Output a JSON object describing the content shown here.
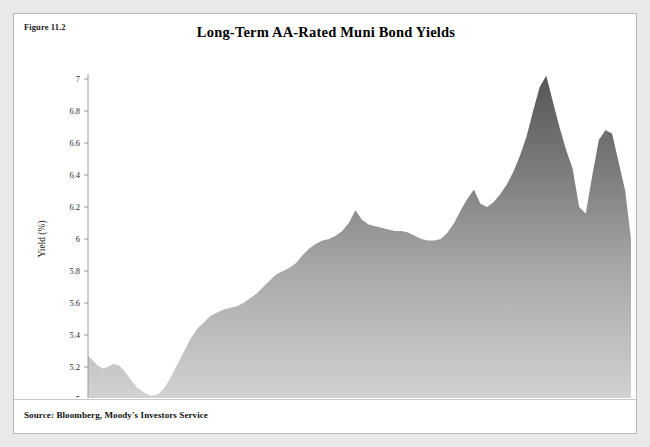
{
  "figure": {
    "label": "Figure 11.2",
    "source": "Source: Bloomberg, Moody's Investors Service"
  },
  "colors": {
    "page_background": "#e9e9e9",
    "card_background": "#ffffff",
    "card_border": "#b9b9b9",
    "area_fill_top": "#5a5a5a",
    "area_fill_bottom": "#cfcfcf",
    "axis_line": "#8c8c8c",
    "text": "#000000"
  },
  "chart_data": {
    "type": "area",
    "title": "Long-Term AA-Rated Muni Bond Yields",
    "xlabel": "",
    "ylabel": "Yield (%)",
    "ylim": [
      5,
      7.1
    ],
    "yticks": [
      5,
      5.2,
      5.4,
      5.6,
      5.8,
      6,
      6.2,
      6.4,
      6.6,
      6.8,
      7
    ],
    "ytick_labels": [
      "5",
      "5.2",
      "5.4",
      "5.6",
      "5.8",
      "6",
      "6.2",
      "6.4",
      "6.6",
      "6.8",
      "7"
    ],
    "xtick_labels": [
      "Dec-1993",
      "Feb-1994",
      "Apr-1994",
      "Jun-1994",
      "Aug-1994",
      "Oct-1994",
      "Dec-1994"
    ],
    "xtick_positions": [
      0,
      2,
      4,
      6,
      8,
      10,
      12
    ],
    "xlim": [
      0,
      13.2
    ],
    "grid": false,
    "legend": false,
    "series": [
      {
        "name": "Long-Term AA-Rated Muni Bond Yield",
        "x": [
          0.0,
          0.12,
          0.24,
          0.36,
          0.48,
          0.62,
          0.76,
          0.9,
          1.04,
          1.2,
          1.36,
          1.52,
          1.7,
          1.86,
          2.02,
          2.18,
          2.34,
          2.5,
          2.66,
          2.82,
          2.98,
          3.14,
          3.3,
          3.46,
          3.62,
          3.78,
          3.94,
          4.1,
          4.26,
          4.42,
          4.58,
          4.74,
          4.9,
          5.06,
          5.22,
          5.38,
          5.54,
          5.7,
          5.86,
          6.02,
          6.18,
          6.34,
          6.5,
          6.66,
          6.82,
          6.98,
          7.14,
          7.3,
          7.46,
          7.62,
          7.78,
          7.94,
          8.1,
          8.26,
          8.42,
          8.58,
          8.74,
          8.9,
          9.06,
          9.22,
          9.38,
          9.54,
          9.7,
          9.86,
          10.02,
          10.18,
          10.34,
          10.5,
          10.66,
          10.82,
          10.98,
          11.14,
          11.3,
          11.46,
          11.62,
          11.78,
          11.94,
          12.1,
          12.26,
          12.42,
          12.58,
          12.74,
          12.9,
          13.06,
          13.2
        ],
        "values": [
          5.27,
          5.24,
          5.21,
          5.19,
          5.2,
          5.22,
          5.21,
          5.17,
          5.12,
          5.07,
          5.04,
          5.02,
          5.03,
          5.07,
          5.14,
          5.22,
          5.3,
          5.38,
          5.44,
          5.48,
          5.52,
          5.54,
          5.56,
          5.57,
          5.58,
          5.6,
          5.63,
          5.66,
          5.7,
          5.74,
          5.78,
          5.8,
          5.82,
          5.85,
          5.9,
          5.94,
          5.97,
          5.99,
          6.0,
          6.02,
          6.05,
          6.1,
          6.18,
          6.12,
          6.09,
          6.08,
          6.07,
          6.06,
          6.05,
          6.05,
          6.04,
          6.02,
          6.0,
          5.99,
          5.99,
          6.0,
          6.04,
          6.1,
          6.18,
          6.25,
          6.31,
          6.22,
          6.2,
          6.23,
          6.28,
          6.34,
          6.42,
          6.52,
          6.64,
          6.8,
          6.95,
          7.02,
          6.86,
          6.7,
          6.56,
          6.44,
          6.2,
          6.16,
          6.4,
          6.62,
          6.68,
          6.66,
          6.48,
          6.3,
          6.0
        ]
      }
    ]
  }
}
